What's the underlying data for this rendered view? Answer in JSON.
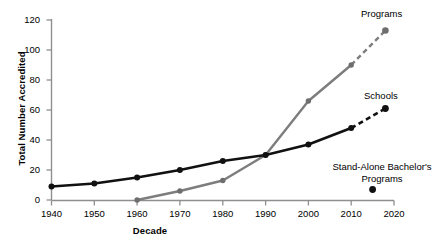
{
  "chart_data": {
    "type": "line",
    "title": "",
    "subtitle": "",
    "xlabel": "Decade",
    "ylabel": "Total Number Accredited",
    "x": [
      1940,
      1950,
      1960,
      1970,
      1980,
      1990,
      2000,
      2010,
      2018
    ],
    "xlim": [
      1940,
      2020
    ],
    "ylim": [
      0,
      120
    ],
    "xticks": [
      "1940",
      "1950",
      "1960",
      "1970",
      "1980",
      "1990",
      "2000",
      "2010",
      "2020"
    ],
    "yticks": [
      "0",
      "20",
      "40",
      "60",
      "80",
      "100",
      "120"
    ],
    "grid": false,
    "legend_position": "annotated-at-line-end",
    "series": [
      {
        "name": "Programs",
        "color": "#7d7d7d",
        "marker": "circle",
        "x": [
          1960,
          1970,
          1980,
          1990,
          2000,
          2010,
          2018
        ],
        "values": [
          0,
          6,
          13,
          30,
          66,
          90,
          113
        ],
        "dashed_tail_from": 2010
      },
      {
        "name": "Schools",
        "color": "#111111",
        "marker": "circle",
        "x": [
          1940,
          1950,
          1960,
          1970,
          1980,
          1990,
          2000,
          2010,
          2018
        ],
        "values": [
          9,
          11,
          15,
          20,
          26,
          30,
          37,
          48,
          61
        ],
        "dashed_tail_from": 2010
      },
      {
        "name": "Stand-Alone Bachelor's Programs",
        "color": "#111111",
        "marker": "circle",
        "x": [
          2015
        ],
        "values": [
          7
        ],
        "single_point": true
      }
    ],
    "annotations": [
      {
        "text": "Programs",
        "x": 2016,
        "y": 120
      },
      {
        "text": "Schools",
        "x": 2014,
        "y": 70
      },
      {
        "text": "Stand-Alone Bachelor's Programs",
        "x": 2012,
        "y": 24
      }
    ]
  },
  "axis": {
    "y_title": "Total Number Accredited",
    "x_title": "Decade"
  },
  "labels": {
    "programs": "Programs",
    "schools": "Schools",
    "standalone_line1": "Stand-Alone Bachelor's",
    "standalone_line2": "Programs"
  },
  "yticks": {
    "t0": "0",
    "t20": "20",
    "t40": "40",
    "t60": "60",
    "t80": "80",
    "t100": "100",
    "t120": "120"
  },
  "xticks": {
    "t1940": "1940",
    "t1950": "1950",
    "t1960": "1960",
    "t1970": "1970",
    "t1980": "1980",
    "t1990": "1990",
    "t2000": "2000",
    "t2010": "2010",
    "t2020": "2020"
  },
  "colors": {
    "programs_line": "#7d7d7d",
    "schools_line": "#111111",
    "axis": "#8f8f8f",
    "text": "#000000"
  }
}
